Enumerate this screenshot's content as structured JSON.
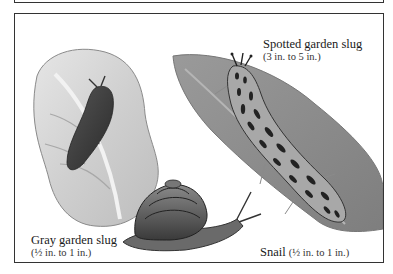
{
  "figure": {
    "colors": {
      "frame": "#333333",
      "background": "#ffffff",
      "ink": "#1a1a1a"
    },
    "labels": [
      {
        "id": "spotted",
        "name": "Spotted garden slug",
        "size": "(3 in. to 5 in.)"
      },
      {
        "id": "gray",
        "name": "Gray garden slug",
        "size": "(½ in. to 1 in.)"
      },
      {
        "id": "snail",
        "name": "Snail",
        "size": "(½ in. to 1 in.)"
      }
    ],
    "illustrations": [
      {
        "id": "gray-slug-on-cabbage-leaf",
        "subject": "Gray garden slug on cabbage leaf"
      },
      {
        "id": "spotted-slug-on-leaf",
        "subject": "Spotted garden slug on leaf"
      },
      {
        "id": "snail",
        "subject": "Snail"
      }
    ]
  }
}
